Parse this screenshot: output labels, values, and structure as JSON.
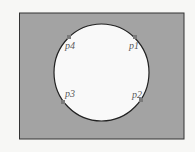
{
  "diagram": {
    "background": "#f7f7f5",
    "rect": {
      "x": 19.5,
      "y": 13,
      "width": 164.5,
      "height": 126,
      "fill": "#a3a3a3",
      "stroke": "#333333"
    },
    "circle": {
      "cx": 101.5,
      "cy": 72.5,
      "rx": 47.5,
      "ry": 48.5,
      "fill": "#f9f9f9",
      "stroke": "#222222"
    },
    "points": [
      {
        "label": "p1",
        "x": 135,
        "y": 37,
        "lx": 129,
        "ly": 49
      },
      {
        "label": "p2",
        "x": 141,
        "y": 100,
        "lx": 132,
        "ly": 98
      },
      {
        "label": "p3",
        "x": 63,
        "y": 102,
        "lx": 65,
        "ly": 97
      },
      {
        "label": "p4",
        "x": 69,
        "y": 37,
        "lx": 65,
        "ly": 49
      }
    ],
    "point_color": "#7a7a7a"
  }
}
